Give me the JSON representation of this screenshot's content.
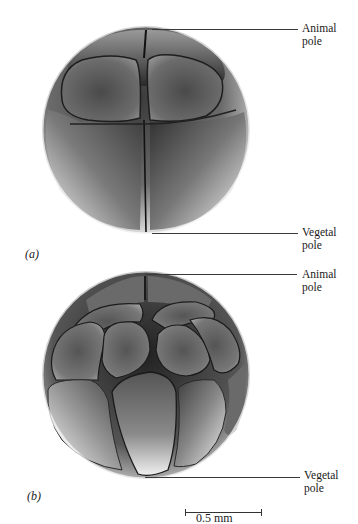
{
  "figure": {
    "panels": [
      {
        "id": "a",
        "letter": "(a)",
        "stage": "8-cell embryo",
        "labels": {
          "animal": {
            "line1": "Animal",
            "line2": "pole"
          },
          "vegetal": {
            "line1": "Vegetal",
            "line2": "pole"
          }
        }
      },
      {
        "id": "b",
        "letter": "(b)",
        "stage": "16-cell embryo",
        "labels": {
          "animal": {
            "line1": "Animal",
            "line2": "pole"
          },
          "vegetal": {
            "line1": "Vegetal",
            "line2": "pole"
          }
        }
      }
    ],
    "scale_bar": {
      "label": "0.5 mm"
    },
    "colors": {
      "background": "#ffffff",
      "cell_dark": "#2a2a2a",
      "cell_mid": "#8a8a8a",
      "cell_light": "#f2f2f2",
      "leader_line": "#3a3a3a"
    }
  }
}
